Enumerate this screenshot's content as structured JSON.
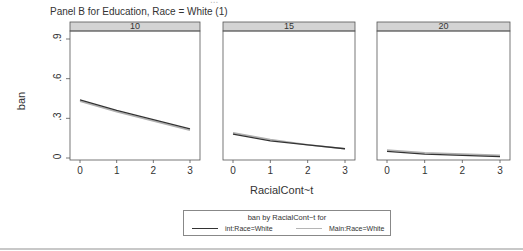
{
  "header": {
    "cut_text": "...",
    "panel_title": "Panel B for Education, Race = White (1)"
  },
  "colors": {
    "strip_bg": "#d3d3d3",
    "int_line": "#333333",
    "main_line": "#b0b0b0",
    "frame": "#555555"
  },
  "chart_data": {
    "type": "line",
    "title": "Panel B for Education, Race = White (1)",
    "xlabel": "RacialCont~t",
    "ylabel": "ban",
    "ylim": [
      0,
      0.9
    ],
    "yticks": [
      "0",
      ".3",
      ".6",
      ".9"
    ],
    "yticks_values": [
      0,
      0.3,
      0.6,
      0.9
    ],
    "xticks": [
      "0",
      "1",
      "2",
      "3"
    ],
    "x": [
      0,
      1,
      2,
      3
    ],
    "grid": false,
    "legend_position": "bottom",
    "legend": {
      "title": "ban by RacialCont~t for",
      "entries": [
        "int:Race=White",
        "Main:Race=White"
      ]
    },
    "panels": [
      {
        "label": "10",
        "series": [
          {
            "name": "int:Race=White",
            "values": [
              0.44,
              0.36,
              0.29,
              0.22
            ]
          },
          {
            "name": "Main:Race=White",
            "values": [
              0.43,
              0.35,
              0.28,
              0.21
            ]
          }
        ]
      },
      {
        "label": "15",
        "series": [
          {
            "name": "int:Race=White",
            "values": [
              0.18,
              0.13,
              0.1,
              0.07
            ]
          },
          {
            "name": "Main:Race=White",
            "values": [
              0.19,
              0.14,
              0.1,
              0.07
            ]
          }
        ]
      },
      {
        "label": "20",
        "series": [
          {
            "name": "int:Race=White",
            "values": [
              0.05,
              0.03,
              0.02,
              0.01
            ]
          },
          {
            "name": "Main:Race=White",
            "values": [
              0.06,
              0.04,
              0.03,
              0.02
            ]
          }
        ]
      }
    ]
  }
}
